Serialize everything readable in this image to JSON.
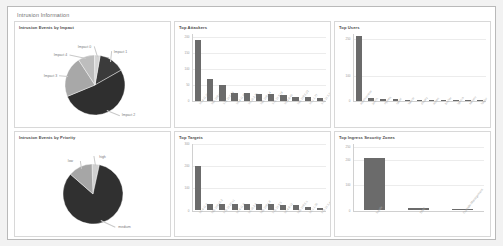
{
  "report": {
    "title": "Intrusion Information"
  },
  "panels": {
    "impact": {
      "title": "Intrusion Events by Impact",
      "labels": [
        "Impact 1",
        "Impact 2",
        "Impact 3",
        "Impact 4",
        "Impact 0"
      ]
    },
    "attackers": {
      "title": "Top Attackers"
    },
    "users": {
      "title": "Top Users"
    },
    "priority": {
      "title": "Intrusion Events by Priority",
      "labels": [
        "high",
        "medium",
        "low"
      ]
    },
    "targets": {
      "title": "Top Targets"
    },
    "zones": {
      "title": "Top Ingress Security Zones"
    }
  },
  "chart_data": [
    {
      "type": "pie",
      "title": "Intrusion Events by Impact",
      "categories": [
        "Impact 1",
        "Impact 2",
        "Impact 3",
        "Impact 4",
        "Impact 0"
      ],
      "values": [
        14,
        52,
        22,
        9,
        3
      ],
      "colors": [
        "#3b3b3b",
        "#2f2f2f",
        "#a8a8a8",
        "#bdbdbd",
        "#d4d4d4"
      ],
      "legend": "none",
      "labels_position": "outside-with-leaders"
    },
    {
      "type": "bar",
      "title": "Top Attackers",
      "xlabel": "",
      "ylabel": "Count",
      "categories": [
        "10.4.11.21",
        "192.168.10.7",
        "172.16.0.54",
        "10.4.11.88",
        "10.10.2.31",
        "192.168.1.4",
        "172.16.8.19",
        "10.4.9.60",
        "192.168.5.22",
        "10.1.1.77",
        "172.16.3.2"
      ],
      "values": [
        190,
        68,
        48,
        24,
        22,
        20,
        19,
        17,
        11,
        10,
        9
      ],
      "yticks": [
        0,
        50,
        100,
        150,
        200
      ],
      "ylim": [
        0,
        210
      ],
      "grid": true,
      "legend": "none"
    },
    {
      "type": "bar",
      "title": "Top Users",
      "xlabel": "",
      "ylabel": "Count",
      "categories": [
        "administrator",
        "jsmith",
        "mjones",
        "rpatel",
        "kwhite",
        "dlopez",
        "achen",
        "bmiller",
        "tgarcia",
        "swilson",
        "ltaylor"
      ],
      "values": [
        260,
        9,
        6,
        5,
        0,
        0,
        0,
        0,
        0,
        0,
        0
      ],
      "yticks": [
        0,
        100,
        250
      ],
      "ylim": [
        0,
        270
      ],
      "grid": true,
      "legend": "none"
    },
    {
      "type": "pie",
      "title": "Intrusion Events by Priority",
      "categories": [
        "high",
        "medium",
        "low"
      ],
      "values": [
        4,
        83,
        13
      ],
      "colors": [
        "#d0d0d0",
        "#303030",
        "#a6a6a6"
      ],
      "legend": "none",
      "labels_position": "outside-with-leaders"
    },
    {
      "type": "bar",
      "title": "Top Targets",
      "xlabel": "",
      "ylabel": "Count",
      "categories": [
        "10.4.11.5",
        "192.168.10.2",
        "172.16.20.11",
        "10.4.11.9",
        "10.10.2.6",
        "192.168.1.8",
        "172.16.8.3",
        "10.4.9.12",
        "192.168.5.1",
        "10.1.1.30",
        "172.16.3.44"
      ],
      "values": [
        198,
        28,
        27,
        26,
        26,
        25,
        25,
        24,
        24,
        12,
        11
      ],
      "yticks": [
        0,
        100,
        200,
        300
      ],
      "ylim": [
        0,
        300
      ],
      "grid": true,
      "legend": "none"
    },
    {
      "type": "bar",
      "title": "Top Ingress Security Zones",
      "xlabel": "",
      "ylabel": "Count",
      "categories": [
        "Inside",
        "DMZ",
        "Outside-Management"
      ],
      "values": [
        205,
        8,
        0
      ],
      "yticks": [
        0,
        100,
        200,
        250
      ],
      "ylim": [
        0,
        265
      ],
      "grid": true,
      "legend": "none"
    }
  ]
}
